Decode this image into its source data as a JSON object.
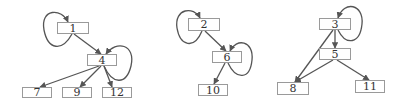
{
  "colors": {
    "edge": "#555555",
    "node_border": "#9a9a9a",
    "text": "#333333"
  },
  "graphs": [
    {
      "nodes": [
        {
          "id": "1",
          "label": "1",
          "x": 57,
          "y": 22,
          "w": 32,
          "h": 12
        },
        {
          "id": "4",
          "label": "4",
          "x": 87,
          "y": 54,
          "w": 30,
          "h": 12
        },
        {
          "id": "7",
          "label": "7",
          "x": 22,
          "y": 87,
          "w": 30,
          "h": 11
        },
        {
          "id": "9",
          "label": "9",
          "x": 62,
          "y": 87,
          "w": 30,
          "h": 11
        },
        {
          "id": "12",
          "label": "12",
          "x": 102,
          "y": 87,
          "w": 30,
          "h": 11
        }
      ],
      "edges": [
        [
          "1",
          "1"
        ],
        [
          "1",
          "4"
        ],
        [
          "4",
          "4"
        ],
        [
          "4",
          "7"
        ],
        [
          "4",
          "9"
        ],
        [
          "4",
          "12"
        ]
      ]
    },
    {
      "nodes": [
        {
          "id": "2",
          "label": "2",
          "x": 188,
          "y": 18,
          "w": 32,
          "h": 13
        },
        {
          "id": "6",
          "label": "6",
          "x": 212,
          "y": 51,
          "w": 30,
          "h": 12
        },
        {
          "id": "10",
          "label": "10",
          "x": 198,
          "y": 84,
          "w": 30,
          "h": 12
        }
      ],
      "edges": [
        [
          "2",
          "2"
        ],
        [
          "2",
          "6"
        ],
        [
          "6",
          "6"
        ],
        [
          "6",
          "10"
        ]
      ]
    },
    {
      "nodes": [
        {
          "id": "3",
          "label": "3",
          "x": 319,
          "y": 18,
          "w": 32,
          "h": 12
        },
        {
          "id": "5",
          "label": "5",
          "x": 319,
          "y": 48,
          "w": 32,
          "h": 12
        },
        {
          "id": "8",
          "label": "8",
          "x": 277,
          "y": 82,
          "w": 32,
          "h": 13
        },
        {
          "id": "11",
          "label": "11",
          "x": 355,
          "y": 80,
          "w": 30,
          "h": 13
        }
      ],
      "edges": [
        [
          "3",
          "3"
        ],
        [
          "3",
          "5"
        ],
        [
          "3",
          "8"
        ],
        [
          "5",
          "8"
        ],
        [
          "5",
          "11"
        ]
      ]
    }
  ]
}
